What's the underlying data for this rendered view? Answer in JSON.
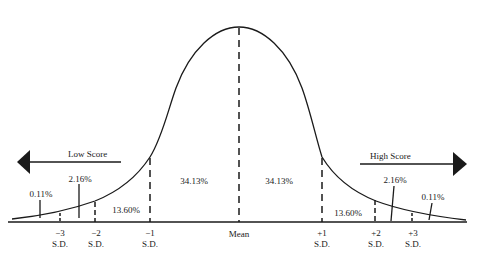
{
  "diagram": {
    "type": "normal-distribution-curve",
    "arrows": {
      "left_label": "Low Score",
      "right_label": "High Score"
    },
    "regions": [
      {
        "label": "0.11%",
        "side": "left"
      },
      {
        "label": "2.16%",
        "side": "left"
      },
      {
        "label": "13.60%",
        "side": "left"
      },
      {
        "label": "34.13%",
        "side": "left"
      },
      {
        "label": "34.13%",
        "side": "right"
      },
      {
        "label": "13.60%",
        "side": "right"
      },
      {
        "label": "2.16%",
        "side": "right"
      },
      {
        "label": "0.11%",
        "side": "right"
      }
    ],
    "ticks": [
      {
        "value": "−3",
        "unit": "S.D."
      },
      {
        "value": "−2",
        "unit": "S.D."
      },
      {
        "value": "−1",
        "unit": "S.D."
      },
      {
        "value": "Mean",
        "unit": ""
      },
      {
        "value": "+1",
        "unit": "S.D."
      },
      {
        "value": "+2",
        "unit": "S.D."
      },
      {
        "value": "+3",
        "unit": "S.D."
      }
    ]
  },
  "colors": {
    "ink": "#1a1a1a",
    "background": "#ffffff"
  }
}
